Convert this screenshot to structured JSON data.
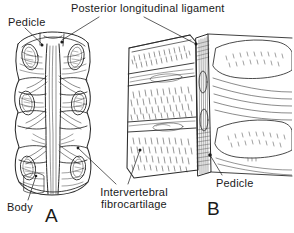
{
  "figure": {
    "background_color": "#ffffff",
    "ink_color": "#1a1a1a",
    "width": 294,
    "height": 233,
    "labels": {
      "title": "Posterior longitudinal ligament",
      "pedicle_left": "Pedicle",
      "body": "Body",
      "intervertebral_line1": "Intervertebral",
      "intervertebral_line2": "fibrocartilage",
      "pedicle_right": "Pedicle",
      "figure_a": "A",
      "figure_b": "B"
    },
    "panels": [
      {
        "letter": "A",
        "view": "posterior view of vertebral bodies with posterior longitudinal ligament",
        "features": [
          "pedicle cut surfaces",
          "vertebral bodies",
          "ligament band",
          "intervertebral fibrocartilage"
        ]
      },
      {
        "letter": "B",
        "view": "sagittal section through vertebral bodies and ligament",
        "features": [
          "cancellous bone stipple",
          "intervertebral discs",
          "ligament strip",
          "pedicle cut surface"
        ]
      }
    ]
  }
}
